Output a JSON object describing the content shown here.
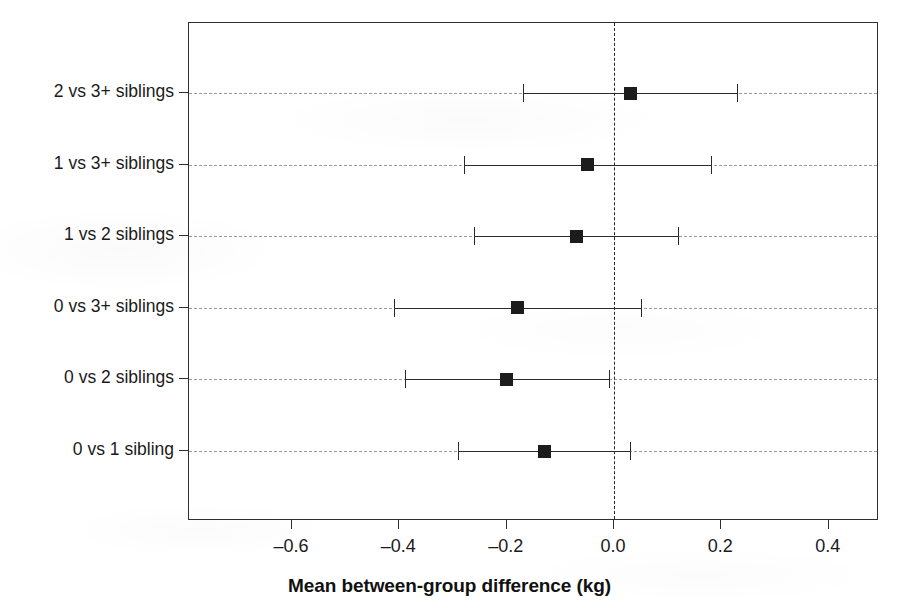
{
  "chart_data": {
    "type": "scatter",
    "subtype": "forest-plot",
    "title": "",
    "xlabel": "Mean between-group difference (kg)",
    "ylabel": "",
    "xlim": [
      -0.76,
      0.495
    ],
    "xticks": [
      -0.6,
      -0.4,
      -0.2,
      0.0,
      0.2,
      0.4
    ],
    "xticklabels": [
      "–0.6",
      "–0.4",
      "–0.2",
      "0.0",
      "0.2",
      "0.4"
    ],
    "categories": [
      "2 vs 3+ siblings",
      "1 vs 3+ siblings",
      "1 vs 2 siblings",
      "0 vs 3+ siblings",
      "0 vs 2 siblings",
      "0 vs 1 sibling"
    ],
    "reference_line": 0.0,
    "reference_line_style": "dashed",
    "grid": "horizontal-dashed",
    "legend": "none",
    "marker": "filled-square",
    "marker_color": "#1c1c1c",
    "line_color": "#2b2b2b",
    "points": [
      {
        "label": "2 vs 3+ siblings",
        "estimate": 0.03,
        "ci_low": -0.17,
        "ci_high": 0.23
      },
      {
        "label": "1 vs 3+ siblings",
        "estimate": -0.05,
        "ci_low": -0.28,
        "ci_high": 0.18
      },
      {
        "label": "1 vs 2 siblings",
        "estimate": -0.07,
        "ci_low": -0.26,
        "ci_high": 0.12
      },
      {
        "label": "0 vs 3+ siblings",
        "estimate": -0.18,
        "ci_low": -0.41,
        "ci_high": 0.05
      },
      {
        "label": "0 vs 2 siblings",
        "estimate": -0.2,
        "ci_low": -0.39,
        "ci_high": -0.01
      },
      {
        "label": "0 vs 1 sibling",
        "estimate": -0.13,
        "ci_low": -0.29,
        "ci_high": 0.03
      }
    ]
  },
  "layout": {
    "plot_left": 188,
    "plot_top": 22,
    "plot_right": 878,
    "plot_bottom": 520,
    "x_zero_px": 613,
    "px_per_unit": 536.7,
    "row_y": [
      92,
      163.6,
      235.2,
      306.8,
      378.4,
      450
    ],
    "tick_len": 9
  }
}
